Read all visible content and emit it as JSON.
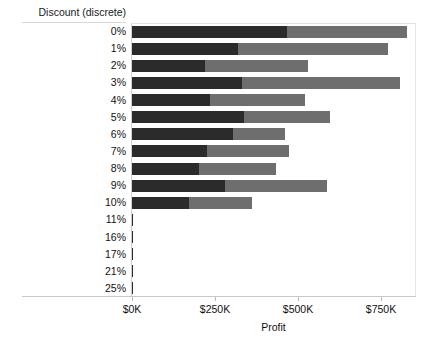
{
  "chart_data": {
    "type": "bar",
    "orientation": "horizontal",
    "stacked": true,
    "title": "",
    "xlabel": "Profit",
    "ylabel": "Discount (discrete)",
    "categories": [
      "0%",
      "1%",
      "2%",
      "3%",
      "4%",
      "5%",
      "6%",
      "7%",
      "8%",
      "9%",
      "10%",
      "11%",
      "16%",
      "17%",
      "21%",
      "25%"
    ],
    "series": [
      {
        "name": "segment-1",
        "color": "#2b2b2b",
        "values": [
          466,
          319,
          221,
          330,
          235,
          336,
          305,
          226,
          203,
          281,
          172,
          2,
          2,
          2,
          2,
          2
        ]
      },
      {
        "name": "segment-2",
        "color": "#6e6e6e",
        "values": [
          361,
          451,
          308,
          476,
          285,
          260,
          156,
          247,
          230,
          305,
          190,
          0,
          0,
          0,
          0,
          0
        ]
      }
    ],
    "totals": [
      827,
      770,
      529,
      806,
      520,
      596,
      461,
      473,
      433,
      586,
      362,
      2,
      2,
      2,
      2,
      2
    ],
    "value_unit": "$K",
    "xticks": [
      0,
      250,
      500,
      750
    ],
    "xtick_labels": [
      "$0K",
      "$250K",
      "$500K",
      "$750K"
    ],
    "xlim": [
      0,
      945
    ],
    "grid": false,
    "legend": "none"
  },
  "axis": {
    "y_caption": "Discount (discrete)",
    "x_title": "Profit"
  }
}
